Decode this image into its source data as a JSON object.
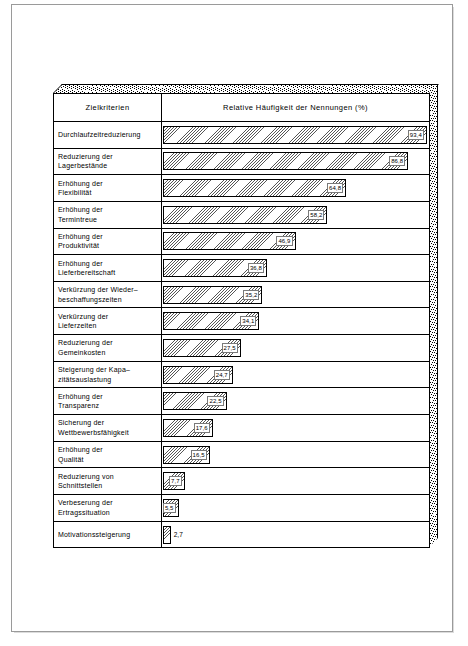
{
  "chart_data": {
    "type": "bar",
    "orientation": "horizontal",
    "title": "",
    "column_headers": {
      "criteria": "Zielkriterien",
      "frequency": "Relative Häufigkeit der Nennungen (%)"
    },
    "xlabel": "Relative Häufigkeit der Nennungen (%)",
    "ylabel": "Zielkriterien",
    "xlim": [
      0,
      100
    ],
    "grid": false,
    "legend": "none",
    "value_format": "comma-decimal",
    "categories": [
      "Durchlaufzeitreduzierung",
      "Reduzierung der Lagerbestände",
      "Erhöhung der Flexibilität",
      "Erhöhung der Termintreue",
      "Erhöhung der Produktivität",
      "Erhöhung der Lieferbereitschaft",
      "Verkürzung der Wiederbeschaffungszeiten",
      "Verkürzung der Lieferzeiten",
      "Reduzierung der Gemeinkosten",
      "Steigerung der Kapazitätsauslastung",
      "Erhöhung der Transparenz",
      "Sicherung der Wettbewerbsfähigkeit",
      "Erhöhung der Qualität",
      "Reduzierung von Schnittstellen",
      "Verbeserung der Ertragssituation",
      "Motivationssteigerung"
    ],
    "values": [
      93.4,
      86.8,
      64.8,
      58.2,
      46.9,
      36.8,
      35.2,
      34.1,
      27.5,
      24.7,
      22.5,
      17.6,
      16.5,
      7.7,
      5.5,
      2.7
    ]
  },
  "rows": [
    {
      "label_lines": [
        "Durchlaufzeitreduzierung"
      ],
      "value": "93,4",
      "pct": 93.4,
      "label_outside": false
    },
    {
      "label_lines": [
        "Reduzierung der",
        "Lagerbestände"
      ],
      "value": "86,8",
      "pct": 86.8,
      "label_outside": false
    },
    {
      "label_lines": [
        "Erhöhung der",
        "Flexibilität"
      ],
      "value": "64,8",
      "pct": 64.8,
      "label_outside": false
    },
    {
      "label_lines": [
        "Erhöhung der",
        "Termintreue"
      ],
      "value": "58,2",
      "pct": 58.2,
      "label_outside": false
    },
    {
      "label_lines": [
        "Erhöhung der",
        "Produktivität"
      ],
      "value": "46,9",
      "pct": 46.9,
      "label_outside": false
    },
    {
      "label_lines": [
        "Erhöhung der",
        "Lieferbereitschaft"
      ],
      "value": "36,8",
      "pct": 36.8,
      "label_outside": false
    },
    {
      "label_lines": [
        "Verkürzung der Wieder–",
        "beschaffungszeiten"
      ],
      "value": "35,2",
      "pct": 35.2,
      "label_outside": false
    },
    {
      "label_lines": [
        "Verkürzung der",
        "Lieferzeiten"
      ],
      "value": "34,1",
      "pct": 34.1,
      "label_outside": false
    },
    {
      "label_lines": [
        "Reduzierung der",
        "Gemeinkosten"
      ],
      "value": "27,5",
      "pct": 27.5,
      "label_outside": false
    },
    {
      "label_lines": [
        "Steigerung der Kapa–",
        "zitätsauslastung"
      ],
      "value": "24,7",
      "pct": 24.7,
      "label_outside": false
    },
    {
      "label_lines": [
        "Erhöhung der",
        "Transparenz"
      ],
      "value": "22,5",
      "pct": 22.5,
      "label_outside": false
    },
    {
      "label_lines": [
        "Sicherung der",
        "Wettbewerbsfähigkeit"
      ],
      "value": "17,6",
      "pct": 17.6,
      "label_outside": false
    },
    {
      "label_lines": [
        "Erhöhung der",
        "Qualität"
      ],
      "value": "16,5",
      "pct": 16.5,
      "label_outside": false
    },
    {
      "label_lines": [
        "Reduzierung von",
        "Schnittstellen"
      ],
      "value": "7,7",
      "pct": 7.7,
      "label_outside": false
    },
    {
      "label_lines": [
        "Verbeserung der",
        "Ertragssituation"
      ],
      "value": "5,5",
      "pct": 5.5,
      "label_outside": false
    },
    {
      "label_lines": [
        "Motivationssteigerung"
      ],
      "value": "2,7",
      "pct": 2.7,
      "label_outside": true
    }
  ],
  "style": {
    "bar_fill": "#d9d9d9",
    "hatch_color": "#565656",
    "border_color": "#000000",
    "page_border": "#9a9a9a"
  }
}
